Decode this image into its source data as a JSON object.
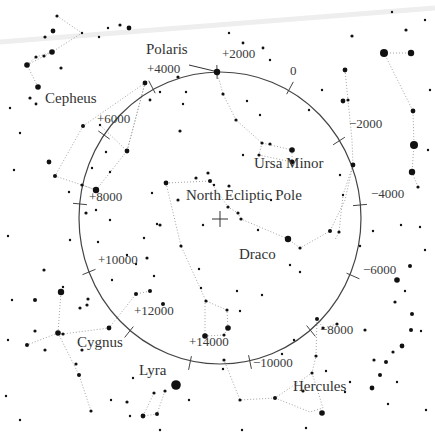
{
  "diagram": {
    "center_label": "North Ecliptic Pole",
    "colors": {
      "background": "#ffffff",
      "stars": "#111111",
      "lines": "#999999",
      "circle": "#444444",
      "text": "#333333",
      "band": "#eeeeee"
    },
    "precession_circle": {
      "cx": 220,
      "cy": 218,
      "rx": 141,
      "ry": 146
    },
    "center_marker": {
      "x": 220,
      "y": 219,
      "size": 8
    },
    "year_ticks": [
      {
        "label": "+2000",
        "x": 217,
        "y": 72,
        "angle": 90,
        "lx": 222,
        "ly": 58
      },
      {
        "label": "0",
        "x": 290,
        "y": 88,
        "angle": 60,
        "lx": 290,
        "ly": 75
      },
      {
        "label": "−2000",
        "x": 339,
        "y": 141,
        "angle": 30,
        "lx": 349,
        "ly": 128
      },
      {
        "label": "−4000",
        "x": 360,
        "y": 205,
        "angle": 2,
        "lx": 371,
        "ly": 198
      },
      {
        "label": "−6000",
        "x": 353,
        "y": 276,
        "angle": -25,
        "lx": 363,
        "ly": 274
      },
      {
        "label": "−8000",
        "x": 311,
        "y": 331,
        "angle": -50,
        "lx": 320,
        "ly": 334
      },
      {
        "label": "−10000",
        "x": 250,
        "y": 362,
        "angle": -80,
        "lx": 253,
        "ly": 367
      },
      {
        "label": "+14000",
        "x": 190,
        "y": 363,
        "angle": 100,
        "lx": 189,
        "ly": 346
      },
      {
        "label": "+12000",
        "x": 129,
        "y": 332,
        "angle": 130,
        "lx": 134,
        "ly": 315
      },
      {
        "label": "+10000",
        "x": 89,
        "y": 272,
        "angle": 155,
        "lx": 98,
        "ly": 264
      },
      {
        "label": "+8000",
        "x": 80,
        "y": 204,
        "angle": 180,
        "lx": 89,
        "ly": 201
      },
      {
        "label": "+6000",
        "x": 104,
        "y": 135,
        "angle": 215,
        "lx": 97,
        "ly": 123
      },
      {
        "label": "+4000",
        "x": 152,
        "y": 87,
        "angle": 240,
        "lx": 147,
        "ly": 73
      }
    ],
    "constellation_labels": [
      {
        "name": "Polaris",
        "x": 146,
        "y": 55
      },
      {
        "name": "Cepheus",
        "x": 45,
        "y": 104
      },
      {
        "name": "Ursa Minor",
        "x": 254,
        "y": 169
      },
      {
        "name": "North Ecliptic Pole",
        "x": 186,
        "y": 201
      },
      {
        "name": "Draco",
        "x": 239,
        "y": 260
      },
      {
        "name": "Cygnus",
        "x": 77,
        "y": 348
      },
      {
        "name": "Lyra",
        "x": 139,
        "y": 376
      },
      {
        "name": "Hercules",
        "x": 293,
        "y": 392
      }
    ],
    "polaris_pointer": {
      "x1": 189,
      "y1": 65,
      "x2": 214,
      "y2": 71
    },
    "constellation_lines": [
      [
        [
          57,
          16
        ],
        [
          82,
          33
        ],
        [
          52,
          52
        ]
      ],
      [
        [
          52,
          52
        ],
        [
          27,
          65
        ],
        [
          38,
          87
        ]
      ],
      [
        [
          27,
          65
        ],
        [
          36,
          57
        ],
        [
          52,
          52
        ]
      ],
      [
        [
          83,
          126
        ],
        [
          145,
          83
        ],
        [
          127,
          151
        ],
        [
          100,
          125
        ]
      ],
      [
        [
          145,
          83
        ],
        [
          127,
          151
        ]
      ],
      [
        [
          83,
          126
        ],
        [
          55,
          176
        ],
        [
          82,
          185
        ],
        [
          96,
          190
        ]
      ],
      [
        [
          82,
          185
        ],
        [
          96,
          190
        ],
        [
          127,
          151
        ]
      ],
      [
        [
          217,
          72
        ],
        [
          223,
          94
        ],
        [
          236,
          120
        ],
        [
          262,
          143
        ],
        [
          292,
          150
        ]
      ],
      [
        [
          262,
          143
        ],
        [
          259,
          155
        ],
        [
          292,
          162
        ],
        [
          292,
          150
        ]
      ],
      [
        [
          345,
          70
        ],
        [
          348,
          100
        ],
        [
          352,
          140
        ],
        [
          353,
          165
        ],
        [
          343,
          195
        ],
        [
          339,
          232
        ],
        [
          335,
          240
        ]
      ],
      [
        [
          384,
          53
        ],
        [
          411,
          53
        ]
      ],
      [
        [
          384,
          53
        ],
        [
          413,
          111
        ],
        [
          414,
          145
        ],
        [
          412,
          172
        ],
        [
          418,
          187
        ]
      ],
      [
        [
          166,
          183
        ],
        [
          210,
          181
        ],
        [
          228,
          207
        ],
        [
          238,
          213
        ],
        [
          241,
          219
        ],
        [
          288,
          239
        ],
        [
          300,
          248
        ],
        [
          330,
          231
        ],
        [
          345,
          200
        ],
        [
          353,
          165
        ]
      ],
      [
        [
          166,
          183
        ],
        [
          181,
          246
        ],
        [
          206,
          301
        ],
        [
          227,
          310
        ],
        [
          228,
          328
        ],
        [
          224,
          335
        ],
        [
          205,
          336
        ],
        [
          205,
          301
        ]
      ],
      [
        [
          58,
          333
        ],
        [
          63,
          334
        ],
        [
          109,
          328
        ],
        [
          136,
          294
        ],
        [
          150,
          291
        ]
      ],
      [
        [
          58,
          333
        ],
        [
          61,
          292
        ]
      ],
      [
        [
          58,
          333
        ],
        [
          27,
          345
        ]
      ],
      [
        [
          58,
          333
        ],
        [
          79,
          375
        ],
        [
          91,
          411
        ]
      ],
      [
        [
          154,
          393
        ],
        [
          143,
          416
        ],
        [
          157,
          414
        ],
        [
          165,
          391
        ]
      ],
      [
        [
          317,
          319
        ],
        [
          323,
          328
        ],
        [
          337,
          324
        ]
      ],
      [
        [
          317,
          319
        ],
        [
          316,
          356
        ],
        [
          312,
          373
        ],
        [
          275,
          398
        ],
        [
          240,
          400
        ],
        [
          224,
          360
        ]
      ],
      [
        [
          275,
          398
        ],
        [
          310,
          412
        ],
        [
          323,
          408
        ],
        [
          312,
          373
        ]
      ]
    ],
    "stars": [
      [
        57,
        16,
        2
      ],
      [
        82,
        33,
        1.5
      ],
      [
        53,
        31,
        3
      ],
      [
        52,
        52,
        3.5
      ],
      [
        44,
        56,
        2
      ],
      [
        36,
        57,
        2
      ],
      [
        27,
        65,
        3.5
      ],
      [
        38,
        87,
        3.5
      ],
      [
        61,
        68,
        2
      ],
      [
        45,
        37,
        2
      ],
      [
        108,
        28,
        1.5
      ],
      [
        129,
        28,
        3
      ],
      [
        120,
        25,
        2
      ],
      [
        99,
        37,
        1.5
      ],
      [
        30,
        98,
        2
      ],
      [
        36,
        104,
        1.8
      ],
      [
        150,
        100,
        1.8
      ],
      [
        83,
        126,
        2.5
      ],
      [
        145,
        83,
        3
      ],
      [
        127,
        151,
        3
      ],
      [
        100,
        125,
        1.5
      ],
      [
        55,
        176,
        2.5
      ],
      [
        49,
        162,
        3
      ],
      [
        82,
        185,
        2
      ],
      [
        96,
        190,
        4
      ],
      [
        86,
        213,
        2
      ],
      [
        110,
        172,
        1.5
      ],
      [
        106,
        152,
        1.5
      ],
      [
        69,
        192,
        1.5
      ],
      [
        92,
        168,
        1.5
      ],
      [
        96,
        210,
        1.5
      ],
      [
        217,
        72,
        4
      ],
      [
        223,
        94,
        2
      ],
      [
        236,
        120,
        2
      ],
      [
        262,
        143,
        2
      ],
      [
        270,
        144,
        2
      ],
      [
        292,
        150,
        3.5
      ],
      [
        292,
        162,
        3
      ],
      [
        259,
        155,
        2
      ],
      [
        243,
        155,
        1.5
      ],
      [
        247,
        101,
        1.5
      ],
      [
        178,
        77,
        2
      ],
      [
        183,
        104,
        1.5
      ],
      [
        186,
        92,
        1.5
      ],
      [
        180,
        131,
        2
      ],
      [
        160,
        92,
        1.5
      ],
      [
        208,
        173,
        2
      ],
      [
        196,
        178,
        2
      ],
      [
        243,
        43,
        1.8
      ],
      [
        263,
        48,
        1.8
      ],
      [
        229,
        33,
        1.5
      ],
      [
        345,
        70,
        3
      ],
      [
        343,
        101,
        3
      ],
      [
        348,
        100,
        2
      ],
      [
        353,
        165,
        3
      ],
      [
        343,
        195,
        1.5
      ],
      [
        339,
        232,
        2
      ],
      [
        340,
        175,
        1.5
      ],
      [
        384,
        53,
        5
      ],
      [
        411,
        53,
        4
      ],
      [
        413,
        111,
        3
      ],
      [
        414,
        145,
        5
      ],
      [
        412,
        172,
        4
      ],
      [
        418,
        187,
        2
      ],
      [
        406,
        30,
        2
      ],
      [
        352,
        36,
        2
      ],
      [
        166,
        183,
        3
      ],
      [
        210,
        181,
        2.5
      ],
      [
        228,
        207,
        2
      ],
      [
        238,
        213,
        2
      ],
      [
        241,
        219,
        2
      ],
      [
        288,
        239,
        4
      ],
      [
        300,
        248,
        2
      ],
      [
        330,
        231,
        2.5
      ],
      [
        178,
        200,
        2
      ],
      [
        152,
        193,
        1.5
      ],
      [
        157,
        224,
        1.5
      ],
      [
        203,
        225,
        1.5
      ],
      [
        214,
        185,
        1.5
      ],
      [
        229,
        186,
        2
      ],
      [
        181,
        246,
        2
      ],
      [
        206,
        301,
        2
      ],
      [
        227,
        310,
        2
      ],
      [
        228,
        328,
        3.5
      ],
      [
        224,
        335,
        2
      ],
      [
        205,
        336,
        3.5
      ],
      [
        201,
        288,
        1.5
      ],
      [
        237,
        291,
        1.5
      ],
      [
        262,
        295,
        1.5
      ],
      [
        163,
        304,
        2.5
      ],
      [
        199,
        269,
        1.5
      ],
      [
        154,
        276,
        1.5
      ],
      [
        147,
        258,
        2
      ],
      [
        144,
        238,
        1.5
      ],
      [
        160,
        225,
        2
      ],
      [
        58,
        333,
        3.5
      ],
      [
        63,
        334,
        2
      ],
      [
        109,
        328,
        3
      ],
      [
        136,
        294,
        2.5
      ],
      [
        150,
        291,
        2.5
      ],
      [
        61,
        292,
        4
      ],
      [
        27,
        345,
        2.5
      ],
      [
        35,
        300,
        2.5
      ],
      [
        88,
        299,
        2
      ],
      [
        87,
        305,
        2
      ],
      [
        79,
        375,
        2.5
      ],
      [
        91,
        411,
        2
      ],
      [
        82,
        350,
        2
      ],
      [
        63,
        287,
        1.5
      ],
      [
        45,
        350,
        2
      ],
      [
        80,
        308,
        2
      ],
      [
        76,
        364,
        2
      ],
      [
        44,
        270,
        2
      ],
      [
        35,
        331,
        2
      ],
      [
        176,
        385,
        6
      ],
      [
        154,
        393,
        2
      ],
      [
        143,
        416,
        3
      ],
      [
        157,
        414,
        2.5
      ],
      [
        165,
        391,
        2
      ],
      [
        133,
        378,
        1.5
      ],
      [
        189,
        400,
        1.5
      ],
      [
        127,
        402,
        2
      ],
      [
        317,
        319,
        2.5
      ],
      [
        323,
        328,
        2
      ],
      [
        337,
        324,
        2
      ],
      [
        316,
        356,
        2
      ],
      [
        312,
        373,
        2
      ],
      [
        275,
        398,
        2.5
      ],
      [
        240,
        400,
        2
      ],
      [
        224,
        360,
        2
      ],
      [
        322,
        413,
        3.5
      ],
      [
        303,
        391,
        2
      ],
      [
        240,
        311,
        1.5
      ],
      [
        223,
        369,
        1.5
      ],
      [
        282,
        354,
        1.5
      ],
      [
        294,
        340,
        1.5
      ],
      [
        326,
        371,
        1.5
      ],
      [
        345,
        392,
        1.5
      ],
      [
        410,
        266,
        2.5
      ],
      [
        397,
        280,
        3.5
      ],
      [
        412,
        314,
        2.5
      ],
      [
        395,
        302,
        2
      ],
      [
        411,
        330,
        2.5
      ],
      [
        402,
        346,
        3
      ],
      [
        393,
        352,
        2
      ],
      [
        386,
        362,
        2.5
      ],
      [
        374,
        360,
        2
      ],
      [
        380,
        375,
        2.5
      ],
      [
        372,
        388,
        3
      ],
      [
        397,
        382,
        1.5
      ],
      [
        350,
        382,
        1.5
      ],
      [
        365,
        330,
        2
      ],
      [
        388,
        404,
        1.5
      ],
      [
        373,
        231,
        1.5
      ],
      [
        401,
        225,
        1.5
      ],
      [
        405,
        291,
        1.5
      ],
      [
        421,
        331,
        1.5
      ],
      [
        420,
        227,
        1.5
      ],
      [
        360,
        246,
        1.5
      ],
      [
        300,
        272,
        1.5
      ],
      [
        290,
        265,
        1.5
      ],
      [
        258,
        230,
        1.5
      ],
      [
        271,
        200,
        1.5
      ],
      [
        260,
        115,
        1.5
      ],
      [
        309,
        110,
        1.5
      ],
      [
        270,
        60,
        1.5
      ],
      [
        322,
        90,
        1.5
      ],
      [
        20,
        133,
        1.5
      ],
      [
        10,
        108,
        1.5
      ],
      [
        14,
        170,
        1.5
      ],
      [
        8,
        236,
        1.5
      ],
      [
        12,
        300,
        1.5
      ],
      [
        8,
        340,
        1.5
      ],
      [
        6,
        396,
        1.5
      ],
      [
        20,
        420,
        1.5
      ],
      [
        110,
        220,
        1.5
      ],
      [
        127,
        255,
        1.5
      ],
      [
        136,
        264,
        1.5
      ],
      [
        112,
        280,
        1.5
      ],
      [
        98,
        242,
        1.5
      ],
      [
        70,
        240,
        1.5
      ],
      [
        111,
        400,
        1.5
      ],
      [
        130,
        416,
        1.5
      ],
      [
        160,
        430,
        1.5
      ],
      [
        242,
        430,
        1.5
      ],
      [
        306,
        428,
        1.5
      ],
      [
        426,
        410,
        1.5
      ],
      [
        428,
        150,
        1.5
      ],
      [
        430,
        90,
        1.5
      ],
      [
        425,
        250,
        1.5
      ],
      [
        425,
        20,
        1.5
      ],
      [
        392,
        12,
        1.5
      ]
    ]
  }
}
